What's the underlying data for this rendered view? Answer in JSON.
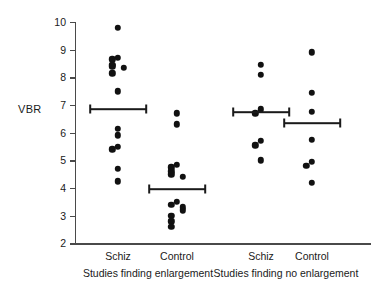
{
  "chart_data": {
    "type": "scatter",
    "title": "",
    "xlabel": "",
    "ylabel": "VBR",
    "ylim": [
      2,
      10
    ],
    "yticks": [
      2,
      3,
      4,
      5,
      6,
      7,
      8,
      9,
      10
    ],
    "ytick_labels": [
      "2",
      "3",
      "4",
      "5",
      "6",
      "7",
      "8",
      "9",
      "10"
    ],
    "grid": false,
    "legend": "none",
    "marker_color": "#111111",
    "axis_color": "#4a4a4a",
    "panels": [
      {
        "label": "Studies finding enlargement",
        "groups": [
          {
            "name": "Schiz",
            "mean": 6.85,
            "mean_ci_low": 6.2,
            "mean_ci_high": 7.8,
            "values": [
              9.8,
              8.7,
              8.65,
              8.45,
              8.4,
              8.35,
              8.15,
              7.5,
              6.15,
              5.9,
              5.5,
              5.4,
              4.7,
              4.25
            ]
          },
          {
            "name": "Control",
            "mean": 3.95,
            "mean_ci_low": 3.4,
            "mean_ci_high": 4.6,
            "values": [
              6.7,
              6.3,
              4.85,
              4.75,
              4.6,
              4.5,
              4.4,
              3.5,
              3.4,
              3.3,
              3.2,
              3.0,
              2.8,
              2.6
            ]
          }
        ]
      },
      {
        "label": "Studies finding no enlargement",
        "groups": [
          {
            "name": "Schiz",
            "mean": 6.75,
            "mean_ci_low": 6.35,
            "mean_ci_high": 7.35,
            "values": [
              8.45,
              8.1,
              6.85,
              6.7,
              5.7,
              5.55,
              5.0
            ]
          },
          {
            "name": "Control",
            "mean": 6.35,
            "mean_ci_low": 5.8,
            "mean_ci_high": 7.0,
            "values": [
              8.9,
              7.45,
              6.75,
              5.75,
              4.95,
              4.8,
              4.2
            ]
          }
        ]
      }
    ]
  },
  "axis": {
    "y_title": "VBR"
  }
}
